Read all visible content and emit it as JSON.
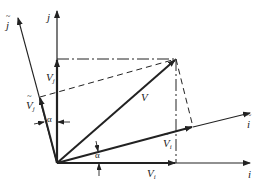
{
  "diagram": {
    "type": "vector-decomposition",
    "colors": {
      "line": "#222222",
      "background": "#ffffff"
    },
    "points": {
      "origin": [
        57,
        163
      ],
      "v_tip": [
        176,
        59
      ],
      "vj_tip": [
        57,
        59
      ],
      "vi_tip": [
        176,
        163
      ],
      "vi_tilde_tip": [
        193,
        127
      ],
      "vj_tilde_tip": [
        40,
        97
      ],
      "i_axis_end": [
        252,
        163
      ],
      "j_axis_end": [
        57,
        10
      ],
      "i_tilde_axis_end": [
        252,
        113
      ],
      "j_tilde_axis_end": [
        17,
        17
      ]
    },
    "labels": {
      "j_axis": "j",
      "i_axis": "i",
      "j_tilde_axis": "j",
      "i_tilde_axis": "i",
      "vector_v": "V",
      "vj": "V",
      "vj_sub": "j",
      "vi": "V",
      "vi_sub": "i",
      "vj_tilde": "V",
      "vj_tilde_sub": "j",
      "vi_tilde": "V",
      "vi_tilde_sub": "i",
      "alpha_top": "α",
      "alpha_bottom": "α"
    }
  }
}
